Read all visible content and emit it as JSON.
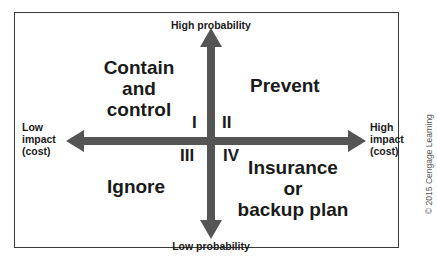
{
  "diagram": {
    "axes": {
      "top": "High probability",
      "bottom": "Low probability",
      "left": [
        "Low",
        "impact",
        "(cost)"
      ],
      "right": [
        "High",
        "impact",
        "(cost)"
      ]
    },
    "quadrants": [
      {
        "numeral": "I",
        "label": [
          "Contain",
          "and",
          "control"
        ]
      },
      {
        "numeral": "II",
        "label": [
          "Prevent"
        ]
      },
      {
        "numeral": "III",
        "label": [
          "Ignore"
        ]
      },
      {
        "numeral": "IV",
        "label": [
          "Insurance",
          "or",
          "backup plan"
        ]
      }
    ],
    "credit": "© 2015 Cengage Learning",
    "colors": {
      "arrow": "#555555",
      "text": "#1a1a1a",
      "border": "#3a3a3a"
    }
  }
}
